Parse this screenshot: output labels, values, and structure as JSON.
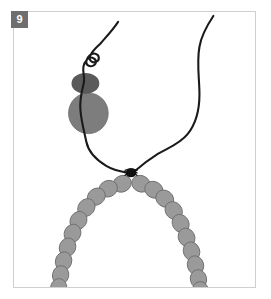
{
  "figure": {
    "panel_label": "9",
    "caption_alt": "Schematic of a chromosome centromere region: two dark filament strands descend from the top, pass a small dark blob and a larger gray blob on the left, cross at a dark knot, and continue as two V-shaped chains of gray bead subunits.",
    "background_color": "#ffffff",
    "frame": {
      "border_color": "#cfcfcf",
      "x": 13,
      "y": 11,
      "width": 243,
      "height": 277
    },
    "label_box": {
      "fill_color": "#6e6e6e",
      "text_color": "#ffffff",
      "x": 11,
      "y": 11,
      "size": 17
    }
  },
  "elements": {
    "strand_color": "#1a1a1a",
    "strand_width": 2.1,
    "knot_color": "#111111",
    "bead_fill": "#9a9a9a",
    "bead_stroke": "#6f6f6f",
    "blob_small_fill": "#5a5a5a",
    "blob_large_fill": "#7d7d7d",
    "blob_large_stroke": "#6a6a6a"
  },
  "geometry": {
    "left_strand_path": "M 118 21 C 112 30 106 36 100 43 C 96 47 92 50 90 55 C 88 60 92 63 96 61 C 100 59 99 54 95 53 C 91 52 87 56 86 60 C 85 64 89 67 93 65 C 97 63 96 58 92 57 C 88 56 84 61 83 66 C 82 72 85 78 83 84 C 81 92 79 100 80 110 C 81 122 84 132 86 142 C 88 152 96 160 106 166 C 114 171 122 172 129 173",
    "right_strand_path": "M 214 15 C 208 24 202 34 200 46 C 197 62 200 78 200 94 C 200 110 196 124 188 134 C 180 144 168 148 158 154 C 150 159 142 165 134 172",
    "knot": {
      "cx": 131,
      "cy": 173,
      "rx": 5.5,
      "ry": 4.5
    },
    "blob_small": {
      "cx": 85,
      "cy": 83,
      "rx": 14,
      "ry": 10.5
    },
    "blob_large": {
      "cx": 88,
      "cy": 113,
      "rx": 20,
      "ry": 20.5
    },
    "left_beads": [
      {
        "cx": 122,
        "cy": 184,
        "angle": -28
      },
      {
        "cx": 108,
        "cy": 189,
        "angle": -22
      },
      {
        "cx": 96,
        "cy": 197,
        "angle": -38
      },
      {
        "cx": 86,
        "cy": 208,
        "angle": -50
      },
      {
        "cx": 78,
        "cy": 221,
        "angle": -58
      },
      {
        "cx": 72,
        "cy": 234,
        "angle": -64
      },
      {
        "cx": 67,
        "cy": 248,
        "angle": -70
      },
      {
        "cx": 63,
        "cy": 262,
        "angle": -74
      },
      {
        "cx": 60,
        "cy": 276,
        "angle": -78
      },
      {
        "cx": 58,
        "cy": 289,
        "angle": -80
      }
    ],
    "right_beads": [
      {
        "cx": 141,
        "cy": 184,
        "angle": 24
      },
      {
        "cx": 154,
        "cy": 190,
        "angle": 28
      },
      {
        "cx": 165,
        "cy": 199,
        "angle": 38
      },
      {
        "cx": 174,
        "cy": 211,
        "angle": 50
      },
      {
        "cx": 181,
        "cy": 224,
        "angle": 58
      },
      {
        "cx": 187,
        "cy": 238,
        "angle": 64
      },
      {
        "cx": 192,
        "cy": 252,
        "angle": 70
      },
      {
        "cx": 196,
        "cy": 266,
        "angle": 74
      },
      {
        "cx": 199,
        "cy": 280,
        "angle": 78
      },
      {
        "cx": 201,
        "cy": 292,
        "angle": 80
      }
    ],
    "bead_rx": 9.5,
    "bead_ry": 8.2
  }
}
